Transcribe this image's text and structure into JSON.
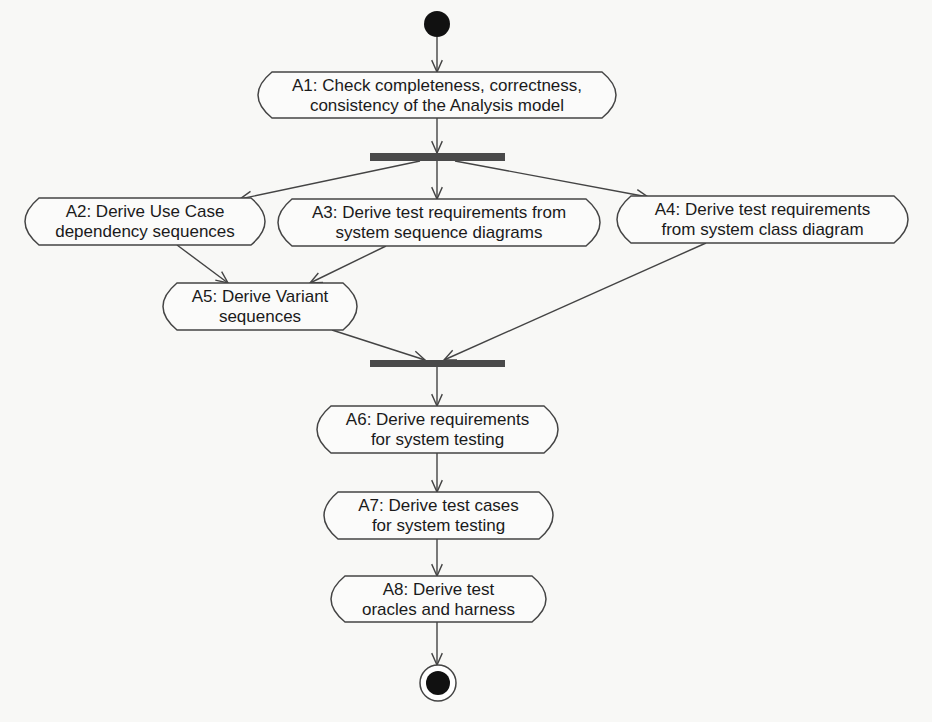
{
  "diagram": {
    "type": "UML activity diagram",
    "colors": {
      "stroke": "#444444",
      "bar": "#4a4a4a",
      "node_fill": "#fbfbfa",
      "text": "#1a1a1a",
      "background": "#f8f8f6"
    },
    "start": {
      "cx": 437,
      "cy": 24,
      "r": 13
    },
    "end": {
      "cx": 438,
      "cy": 683,
      "r_outer": 18,
      "r_inner": 12
    },
    "bars": [
      {
        "id": "fork",
        "x": 370,
        "y": 153,
        "w": 135,
        "h": 8
      },
      {
        "id": "join",
        "x": 370,
        "y": 360,
        "w": 135,
        "h": 7
      }
    ],
    "activities": [
      {
        "id": "A1",
        "x": 258,
        "y": 72,
        "w": 358,
        "h": 46,
        "lines": [
          "A1: Check completeness, correctness,",
          "consistency of the Analysis model"
        ]
      },
      {
        "id": "A2",
        "x": 25,
        "y": 198,
        "w": 240,
        "h": 47,
        "lines": [
          "A2: Derive Use Case",
          "dependency sequences"
        ]
      },
      {
        "id": "A3",
        "x": 278,
        "y": 199,
        "w": 322,
        "h": 47,
        "lines": [
          "A3: Derive test requirements from",
          "system sequence diagrams"
        ]
      },
      {
        "id": "A4",
        "x": 617,
        "y": 196,
        "w": 291,
        "h": 47,
        "lines": [
          "A4: Derive test requirements",
          "from system class diagram"
        ]
      },
      {
        "id": "A5",
        "x": 163,
        "y": 283,
        "w": 194,
        "h": 47,
        "lines": [
          "A5: Derive Variant",
          "sequences"
        ]
      },
      {
        "id": "A6",
        "x": 317,
        "y": 406,
        "w": 241,
        "h": 47,
        "lines": [
          "A6: Derive requirements",
          "for system testing"
        ]
      },
      {
        "id": "A7",
        "x": 324,
        "y": 492,
        "w": 229,
        "h": 47,
        "lines": [
          "A7: Derive test cases",
          "for system testing"
        ]
      },
      {
        "id": "A8",
        "x": 331,
        "y": 576,
        "w": 215,
        "h": 46,
        "lines": [
          "A8: Derive test",
          "oracles and harness"
        ]
      }
    ],
    "transitions": [
      {
        "from": "start",
        "to": "A1",
        "x1": 437,
        "y1": 37,
        "x2": 437,
        "y2": 72
      },
      {
        "from": "A1",
        "to": "fork",
        "x1": 437,
        "y1": 118,
        "x2": 437,
        "y2": 153
      },
      {
        "from": "fork",
        "to": "A2",
        "x1": 420,
        "y1": 161,
        "x2": 240,
        "y2": 199
      },
      {
        "from": "fork",
        "to": "A3",
        "x1": 437,
        "y1": 161,
        "x2": 437,
        "y2": 199
      },
      {
        "from": "fork",
        "to": "A4",
        "x1": 455,
        "y1": 161,
        "x2": 648,
        "y2": 197
      },
      {
        "from": "A2",
        "to": "A5",
        "x1": 177,
        "y1": 245,
        "x2": 228,
        "y2": 283
      },
      {
        "from": "A3",
        "to": "A5",
        "x1": 386,
        "y1": 246,
        "x2": 310,
        "y2": 283
      },
      {
        "from": "A5",
        "to": "join",
        "x1": 332,
        "y1": 330,
        "x2": 425,
        "y2": 360
      },
      {
        "from": "A4",
        "to": "join",
        "x1": 706,
        "y1": 243,
        "x2": 444,
        "y2": 360
      },
      {
        "from": "join",
        "to": "A6",
        "x1": 437,
        "y1": 367,
        "x2": 437,
        "y2": 406
      },
      {
        "from": "A6",
        "to": "A7",
        "x1": 437,
        "y1": 453,
        "x2": 437,
        "y2": 492
      },
      {
        "from": "A7",
        "to": "A8",
        "x1": 437,
        "y1": 539,
        "x2": 437,
        "y2": 576
      },
      {
        "from": "A8",
        "to": "end",
        "x1": 437,
        "y1": 622,
        "x2": 437,
        "y2": 665
      }
    ]
  }
}
